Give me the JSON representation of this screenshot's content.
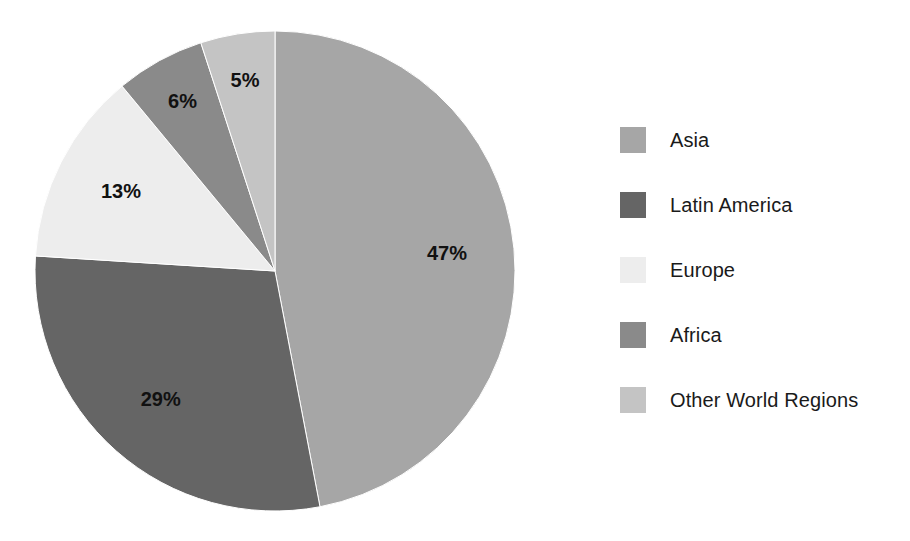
{
  "chart_data": {
    "type": "pie",
    "title": "",
    "subtitle": "",
    "categories": [
      "Asia",
      "Latin America",
      "Europe",
      "Africa",
      "Other World Regions"
    ],
    "values": [
      47,
      29,
      13,
      6,
      5
    ],
    "unit": "%",
    "start_angle_deg": 0,
    "direction": "clockwise",
    "grid": false,
    "legend_position": "right",
    "data_labels": [
      "47%",
      "29%",
      "13%",
      "6%",
      "5%"
    ],
    "colors": [
      "#a6a6a6",
      "#656565",
      "#ededed",
      "#8a8a8a",
      "#c4c4c4"
    ],
    "slices": [
      {
        "label": "Asia",
        "value": 47,
        "data_label": "47%",
        "color": "#a6a6a6"
      },
      {
        "label": "Latin America",
        "value": 29,
        "data_label": "29%",
        "color": "#656565"
      },
      {
        "label": "Europe",
        "value": 13,
        "data_label": "13%",
        "color": "#ededed"
      },
      {
        "label": "Africa",
        "value": 6,
        "data_label": "6%",
        "color": "#8a8a8a"
      },
      {
        "label": "Other World Regions",
        "value": 5,
        "data_label": "5%",
        "color": "#c4c4c4"
      }
    ]
  },
  "legend": {
    "items": [
      {
        "label": "Asia",
        "color": "#a6a6a6"
      },
      {
        "label": "Latin America",
        "color": "#656565"
      },
      {
        "label": "Europe",
        "color": "#ededed"
      },
      {
        "label": "Africa",
        "color": "#8a8a8a"
      },
      {
        "label": "Other World Regions",
        "color": "#c4c4c4"
      }
    ]
  },
  "geometry": {
    "center_x": 275,
    "center_y": 271,
    "radius": 240,
    "label_radius_factor": 0.72
  }
}
